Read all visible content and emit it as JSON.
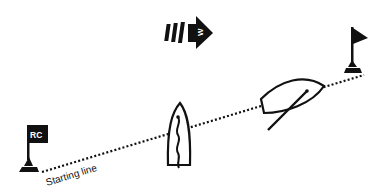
{
  "diagram": {
    "type": "sailing-race-start",
    "labels": {
      "committee_flag": "RC",
      "starting_line": "Starting line",
      "wind_letter": "W"
    },
    "elements": [
      {
        "name": "wind-arrow",
        "description": "Wind direction arrow pointing right"
      },
      {
        "name": "committee-boat-flag",
        "description": "RC flag at left end of starting line"
      },
      {
        "name": "pin-end-flag",
        "description": "Flag mark at right end of starting line"
      },
      {
        "name": "starting-line",
        "description": "Dotted line between the two marks"
      },
      {
        "name": "boat-upright",
        "description": "Boat pointing up with wavy centerline"
      },
      {
        "name": "boat-angled",
        "description": "Boat angled on the line with boom"
      }
    ],
    "colors": {
      "ink": "#111111",
      "background": "#ffffff"
    }
  }
}
